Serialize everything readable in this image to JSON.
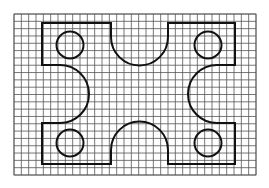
{
  "diagram": {
    "title": "",
    "grid": {
      "x0": 14,
      "y0": 14,
      "x1": 256,
      "y1": 175,
      "cols": 33,
      "rows": 22,
      "color": "#555555"
    },
    "outline": {
      "color": "#111111",
      "left": 42,
      "right": 235,
      "top": 23,
      "bottom": 164,
      "top_notch": {
        "x_left": 111,
        "x_right": 168,
        "center_y": 37,
        "radius": 28.5
      },
      "bottom_notch": {
        "x_left": 111,
        "x_right": 168,
        "center_y": 150,
        "radius": 28.5
      },
      "left_notch": {
        "y_top": 65,
        "y_bottom": 123,
        "center_x": 60,
        "radius": 29
      },
      "right_notch": {
        "y_top": 65,
        "y_bottom": 123,
        "center_x": 217,
        "radius": 29
      }
    },
    "holes": [
      {
        "name": "top-left-hole",
        "cx": 70,
        "cy": 45,
        "r": 13.5
      },
      {
        "name": "top-right-hole",
        "cx": 208,
        "cy": 45,
        "r": 13.5
      },
      {
        "name": "bottom-left-hole",
        "cx": 70,
        "cy": 143,
        "r": 13.5
      },
      {
        "name": "bottom-right-hole",
        "cx": 208,
        "cy": 143,
        "r": 13.5
      }
    ]
  }
}
